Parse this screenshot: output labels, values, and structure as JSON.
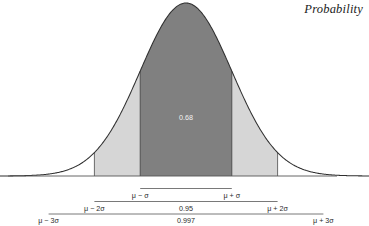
{
  "header": {
    "title": "Probability"
  },
  "chart_data": {
    "type": "area",
    "title": "Probability",
    "distribution": "normal",
    "xlabel": "",
    "ylabel": "",
    "grid": false,
    "legend_position": "none",
    "xlim": [
      -4.0,
      4.0
    ],
    "ylim": [
      0.0,
      0.42
    ],
    "mean_label": "μ",
    "sigma_label": "σ",
    "curve_color": "#2f2f2f",
    "axis_color": "#555555",
    "regions": [
      {
        "name": "one-sigma",
        "from": -1.0,
        "to": 1.0,
        "probability": 0.68,
        "label": "0.68",
        "fill": "#808080",
        "label_color": "#f2f2f2"
      },
      {
        "name": "two-sigma",
        "from": -2.0,
        "to": 2.0,
        "probability": 0.95,
        "label": "0.95",
        "fill": "#d6d6d6",
        "label_color": "#2b2b2b"
      },
      {
        "name": "three-sigma",
        "from": -3.0,
        "to": 3.0,
        "probability": 0.997,
        "label": "0.997",
        "fill": "#ffffff",
        "label_color": "#2b2b2b"
      }
    ],
    "tick_labels": [
      {
        "name": "minus-3-sigma",
        "x": -3.0,
        "text": "μ − 3σ"
      },
      {
        "name": "minus-2-sigma",
        "x": -2.0,
        "text": "μ − 2σ"
      },
      {
        "name": "minus-1-sigma",
        "x": -1.0,
        "text": "μ − σ"
      },
      {
        "name": "plus-1-sigma",
        "x": 1.0,
        "text": "μ + σ"
      },
      {
        "name": "plus-2-sigma",
        "x": 2.0,
        "text": "μ + 2σ"
      },
      {
        "name": "plus-3-sigma",
        "x": 3.0,
        "text": "μ + 3σ"
      }
    ],
    "brackets": [
      {
        "name": "bracket-one-sigma",
        "from": -1.0,
        "to": 1.0,
        "value": ""
      },
      {
        "name": "bracket-two-sigma",
        "from": -2.0,
        "to": 2.0,
        "value": "0.95"
      },
      {
        "name": "bracket-three-sigma",
        "from": -3.0,
        "to": 3.0,
        "value": "0.997"
      }
    ],
    "inner_label": "0.68"
  },
  "labels": {
    "minus3": "μ − 3σ",
    "minus2": "μ − 2σ",
    "minus1": "μ − σ",
    "plus1": "μ + σ",
    "plus2": "μ + 2σ",
    "plus3": "μ + 3σ",
    "p68": "0.68",
    "p95": "0.95",
    "p997": "0.997"
  }
}
